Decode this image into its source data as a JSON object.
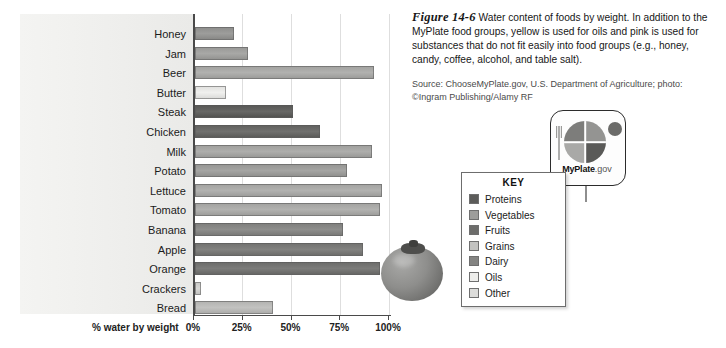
{
  "figure": {
    "number": "Figure 14-6",
    "caption": "Water content of foods by weight. In addition to the MyPlate food groups, yellow is used for oils and pink is used for substances that do not fit easily into food groups (e.g., honey, candy, coffee, alcohol, and table salt).",
    "source_line_1": "Source: ChooseMyPlate.gov, U.S. Department of Agriculture; photo:",
    "source_line_2": "©Ingram Publishing/Alamy RF"
  },
  "chart_data": {
    "type": "bar",
    "orientation": "horizontal",
    "title": "Water content of foods by weight",
    "xlabel": "% water by weight",
    "ylabel": "",
    "xlim": [
      0,
      100
    ],
    "grid": true,
    "tick_labels": [
      "0%",
      "25%",
      "50%",
      "75%",
      "100%"
    ],
    "tick_values": [
      0,
      25,
      50,
      75,
      100
    ],
    "categories": [
      "Honey",
      "Jam",
      "Beer",
      "Butter",
      "Steak",
      "Chicken",
      "Milk",
      "Potato",
      "Lettuce",
      "Tomato",
      "Banana",
      "Apple",
      "Orange",
      "Crackers",
      "Bread"
    ],
    "values": [
      20,
      27,
      92,
      16,
      50,
      64,
      91,
      78,
      96,
      95,
      76,
      86,
      95,
      3,
      40
    ],
    "group": [
      "Other",
      "Other",
      "Other",
      "Oils",
      "Proteins",
      "Proteins",
      "Dairy",
      "Vegetables",
      "Vegetables",
      "Vegetables",
      "Fruits",
      "Fruits",
      "Fruits",
      "Grains",
      "Grains"
    ],
    "bar_colors": [
      "#8f8f8d",
      "#9a9a98",
      "#a3a3a1",
      "#e2e2e0",
      "#595957",
      "#626260",
      "#a0a09e",
      "#979795",
      "#a4a4a2",
      "#a4a4a2",
      "#80807e",
      "#747472",
      "#6e6e6c",
      "#c9c9c7",
      "#b4b4b2"
    ]
  },
  "legend": {
    "title": "KEY",
    "items": [
      {
        "label": "Proteins",
        "color": "#5c5c5a"
      },
      {
        "label": "Vegetables",
        "color": "#9d9d9b"
      },
      {
        "label": "Fruits",
        "color": "#6d6d6b"
      },
      {
        "label": "Grains",
        "color": "#c2c2c0"
      },
      {
        "label": "Dairy",
        "color": "#848482"
      },
      {
        "label": "Oils",
        "color": "#ededeb"
      },
      {
        "label": "Other",
        "color": "#dcdcda"
      }
    ]
  },
  "myplate": {
    "brand_bold": "MyPlate",
    "brand_suffix": ".gov",
    "quadrant_colors": {
      "top_left": "#7d7d7b",
      "top_right": "#949492",
      "bottom_left": "#a9a9a7",
      "bottom_right": "#5a5a58",
      "cup": "#6b6b69",
      "fork": "#9b9b99"
    }
  }
}
